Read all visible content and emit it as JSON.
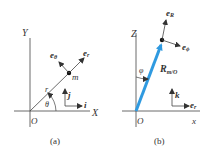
{
  "panel_a": {
    "caption": "(a)",
    "y_axis_label": "Y",
    "x_axis_label": "X",
    "origin_label": "O",
    "radius_label": "r",
    "angle_label": "θ",
    "mass_label": "m",
    "unit_vectors": {
      "e_r": {
        "base": "e",
        "sub": "r"
      },
      "e_theta": {
        "base": "e",
        "sub": "θ"
      },
      "i": "i",
      "j": "j"
    }
  },
  "panel_b": {
    "caption": "(b)",
    "z_axis_label": "Z",
    "x_axis_label": "x",
    "origin_label": "O",
    "angle_label": "φ",
    "position_vector": {
      "base": "R",
      "sub": "m/O"
    },
    "unit_vectors": {
      "e_R": {
        "base": "e",
        "sub": "R"
      },
      "e_phi": {
        "base": "e",
        "sub": "ϕ"
      },
      "k": "k",
      "e_r": {
        "base": "e",
        "sub": "r"
      }
    }
  },
  "colors": {
    "line": "#333333",
    "accent_vector": "#2f9ae0",
    "background": "#ffffff"
  }
}
